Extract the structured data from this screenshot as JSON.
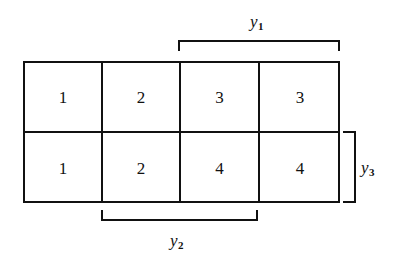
{
  "figure": {
    "background_color": "#ffffff",
    "line_color": "#111111"
  },
  "grid": {
    "rows": 2,
    "columns": 4,
    "cells": [
      [
        "1",
        "2",
        "3",
        "3"
      ],
      [
        "1",
        "2",
        "4",
        "4"
      ]
    ]
  },
  "brackets": [
    {
      "id": "y1",
      "label": "y",
      "subscript": "1",
      "orientation": "horizontal",
      "position": "top",
      "spans_columns": [
        3,
        4
      ]
    },
    {
      "id": "y2",
      "label": "y",
      "subscript": "2",
      "orientation": "horizontal",
      "position": "bottom",
      "spans_columns": [
        2,
        3
      ]
    },
    {
      "id": "y3",
      "label": "y",
      "subscript": "3",
      "orientation": "vertical",
      "position": "right",
      "spans_rows": [
        2
      ]
    }
  ]
}
